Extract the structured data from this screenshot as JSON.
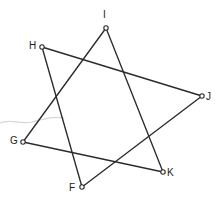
{
  "figure": {
    "canvas": {
      "width": 220,
      "height": 208,
      "background": "#ffffff"
    },
    "style": {
      "line_color": "#2b2b2b",
      "line_width": 1.35,
      "marker_fill": "#ffffff",
      "marker_radius": 2.2,
      "label_color": "#1d1d1d",
      "label_font_size": 10,
      "smudge_color": "#d9d6d4"
    },
    "vertices": [
      {
        "id": "F",
        "label": "F",
        "x": 82,
        "y": 187,
        "label_x": 69,
        "label_y": 183
      },
      {
        "id": "G",
        "label": "G",
        "x": 23,
        "y": 142,
        "label_x": 10,
        "label_y": 136
      },
      {
        "id": "H",
        "label": "H",
        "x": 42,
        "y": 47,
        "label_x": 29,
        "label_y": 41
      },
      {
        "id": "I",
        "label": "I",
        "x": 106,
        "y": 28,
        "label_x": 103,
        "label_y": 10
      },
      {
        "id": "J",
        "label": "J",
        "x": 202,
        "y": 96,
        "label_x": 206,
        "label_y": 92
      },
      {
        "id": "K",
        "label": "K",
        "x": 163,
        "y": 172,
        "label_x": 167,
        "label_y": 168
      }
    ],
    "edges": [
      {
        "id": "edge-H-J",
        "from": "H",
        "to": "J",
        "x1": 42,
        "y1": 47,
        "x2": 202,
        "y2": 96
      },
      {
        "id": "edge-H-F",
        "from": "H",
        "to": "F",
        "x1": 42,
        "y1": 47,
        "x2": 82,
        "y2": 187
      },
      {
        "id": "edge-I-G",
        "from": "I",
        "to": "G",
        "x1": 106,
        "y1": 28,
        "x2": 23,
        "y2": 142
      },
      {
        "id": "edge-I-K",
        "from": "I",
        "to": "K",
        "x1": 106,
        "y1": 28,
        "x2": 163,
        "y2": 172
      },
      {
        "id": "edge-G-K",
        "from": "G",
        "to": "K",
        "x1": 23,
        "y1": 142,
        "x2": 163,
        "y2": 172
      },
      {
        "id": "edge-F-J",
        "from": "F",
        "to": "J",
        "x1": 82,
        "y1": 187,
        "x2": 202,
        "y2": 96
      }
    ],
    "artifact": {
      "name": "scan-smudge",
      "path": "M 0 123 C 10 118, 20 125, 32 122 C 44 119, 54 116, 64 118"
    }
  }
}
